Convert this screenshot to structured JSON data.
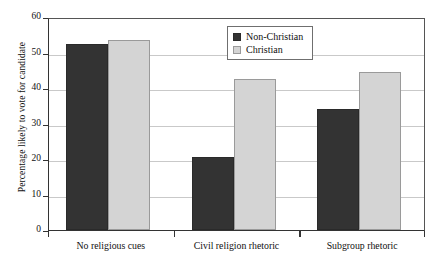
{
  "chart_data": {
    "type": "bar",
    "title": "",
    "xlabel": "",
    "ylabel": "Percentage likely to vote for candidate",
    "categories": [
      "No religious cues",
      "Civil religion rhetoric",
      "Subgroup rhetoric"
    ],
    "series": [
      {
        "name": "Non-Christian",
        "color": "#333333",
        "values": [
          52.4,
          20.6,
          34.2
        ]
      },
      {
        "name": "Christian",
        "color": "#d4d4d4",
        "values": [
          53.6,
          42.4,
          44.5
        ]
      }
    ],
    "ylim": [
      0,
      60
    ],
    "yticks": [
      0,
      10,
      20,
      30,
      40,
      50,
      60
    ],
    "ytick_labels": [
      "0",
      "10",
      "20",
      "30",
      "40",
      "50",
      "60"
    ],
    "grid": true,
    "legend_position": "top-center"
  },
  "legend": {
    "items": [
      {
        "label": "Non-Christian"
      },
      {
        "label": "Christian"
      }
    ]
  }
}
